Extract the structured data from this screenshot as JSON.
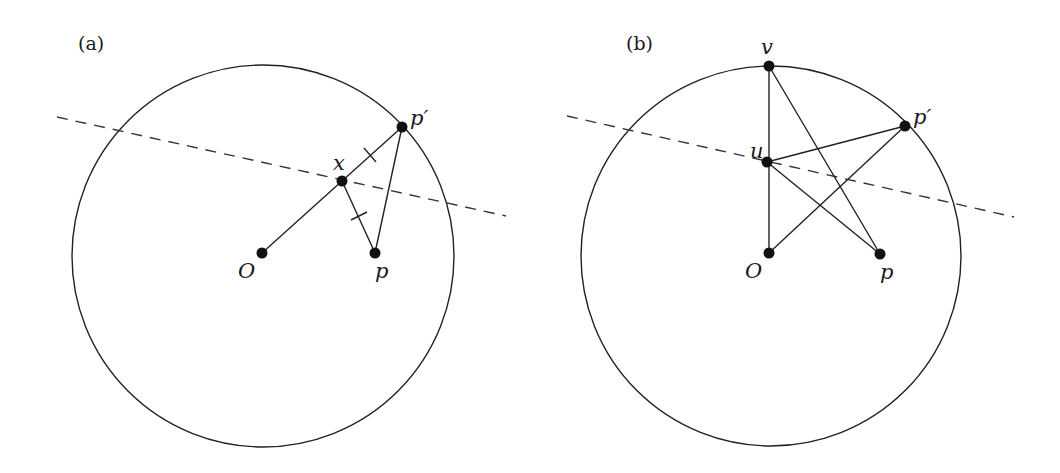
{
  "figure": {
    "panels": [
      {
        "label": "(a)",
        "circle": {
          "cx": 263,
          "cy": 256,
          "r": 191
        },
        "bisector": {
          "x1": 57,
          "y1": 117,
          "x2": 506,
          "y2": 216
        },
        "points": {
          "O": {
            "label": "O",
            "x": 262,
            "y": 253
          },
          "p": {
            "label": "p",
            "x": 375,
            "y": 253
          },
          "x": {
            "label": "x",
            "x": 342,
            "y": 181
          },
          "p_prime": {
            "label": "p′",
            "x": 402,
            "y": 127
          }
        },
        "segments": [
          "O-p_prime",
          "x-p",
          "p-p_prime"
        ],
        "equal_tick_marks": [
          "x-p_prime",
          "x-p"
        ]
      },
      {
        "label": "(b)",
        "circle": {
          "cx": 771,
          "cy": 256,
          "r": 190
        },
        "bisector": {
          "x1": 567,
          "y1": 116,
          "x2": 1014,
          "y2": 217
        },
        "points": {
          "v": {
            "label": "v",
            "x": 769,
            "y": 66
          },
          "u": {
            "label": "u",
            "x": 767,
            "y": 162
          },
          "O": {
            "label": "O",
            "x": 769,
            "y": 253
          },
          "p": {
            "label": "p",
            "x": 880,
            "y": 254
          },
          "p_prime": {
            "label": "p′",
            "x": 905,
            "y": 126
          }
        },
        "segments": [
          "v-O",
          "v-p",
          "u-p_prime",
          "u-p",
          "O-p_prime"
        ]
      }
    ]
  },
  "colors": {
    "stroke": "#222222",
    "background": "#ffffff"
  }
}
